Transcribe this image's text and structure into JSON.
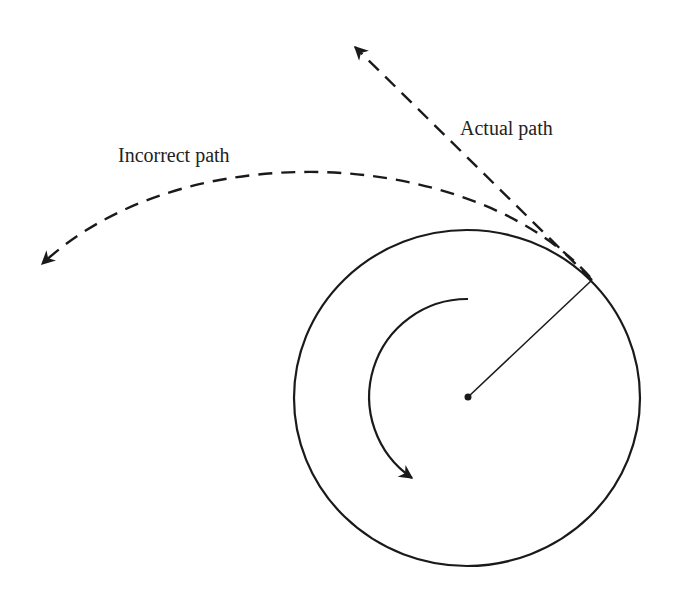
{
  "diagram": {
    "labels": {
      "actual_path": "Actual path",
      "incorrect_path": "Incorrect path"
    },
    "colors": {
      "stroke": "#1a1a1a",
      "text": "#222222",
      "background": "#ffffff"
    },
    "circle": {
      "cx": 467,
      "cy": 398,
      "rx": 173,
      "ry": 168
    },
    "center_point": {
      "x": 468,
      "y": 397
    },
    "tangent_point": {
      "x": 592,
      "y": 280
    },
    "rotation_direction": "counterclockwise"
  }
}
